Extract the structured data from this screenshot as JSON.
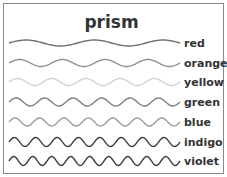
{
  "title": "prism",
  "waves": [
    {
      "label": "red",
      "color": "#6e6e6e",
      "cycles": 2.5,
      "amp": 3,
      "y": 43
    },
    {
      "label": "orange",
      "color": "#8f8f8f",
      "cycles": 4,
      "amp": 3.5,
      "y": 63
    },
    {
      "label": "yellow",
      "color": "#d2d2d2",
      "cycles": 5,
      "amp": 3.5,
      "y": 82
    },
    {
      "label": "green",
      "color": "#7d7d7d",
      "cycles": 6,
      "amp": 4,
      "y": 102
    },
    {
      "label": "blue",
      "color": "#9a9a9a",
      "cycles": 7,
      "amp": 4,
      "y": 122
    },
    {
      "label": "indigo",
      "color": "#3c3c3c",
      "cycles": 8,
      "amp": 4.5,
      "y": 142
    },
    {
      "label": "violet",
      "color": "#3a3a3a",
      "cycles": 9,
      "amp": 4.5,
      "y": 161
    }
  ]
}
